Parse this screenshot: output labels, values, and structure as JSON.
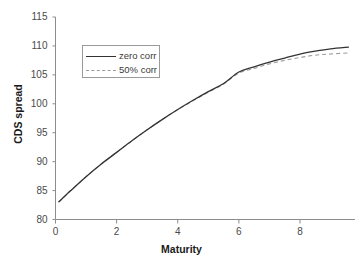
{
  "chart_data": {
    "type": "line",
    "title": "",
    "xlabel": "Maturity",
    "ylabel": "CDS spread",
    "xlim": [
      0,
      9.8
    ],
    "ylim": [
      80,
      115
    ],
    "xticks": [
      "0",
      "2",
      "4",
      "6",
      "8"
    ],
    "xtick_values": [
      0,
      2,
      4,
      6,
      8
    ],
    "yticks": [
      "80",
      "85",
      "90",
      "95",
      "100",
      "105",
      "110",
      "115"
    ],
    "ytick_values": [
      80,
      85,
      90,
      95,
      100,
      105,
      110,
      115
    ],
    "grid": false,
    "legend_position": "upper left",
    "series": [
      {
        "name": "zero corr",
        "style": "solid",
        "color": "#333333",
        "x": [
          0.1,
          0.5,
          1.0,
          1.5,
          2.0,
          2.5,
          3.0,
          3.5,
          4.0,
          4.5,
          5.0,
          5.5,
          6.0,
          6.5,
          7.0,
          7.5,
          8.0,
          8.5,
          9.0,
          9.6
        ],
        "y": [
          83.0,
          85.0,
          87.4,
          89.6,
          91.6,
          93.6,
          95.5,
          97.3,
          99.0,
          100.6,
          102.1,
          103.5,
          105.5,
          106.4,
          107.2,
          107.9,
          108.6,
          109.1,
          109.5,
          109.8
        ]
      },
      {
        "name": "50% corr",
        "style": "dashed",
        "color": "#9b9b9b",
        "x": [
          0.1,
          0.5,
          1.0,
          1.5,
          2.0,
          2.5,
          3.0,
          3.5,
          4.0,
          4.5,
          5.0,
          5.5,
          6.0,
          6.5,
          7.0,
          7.5,
          8.0,
          8.5,
          9.0,
          9.6
        ],
        "y": [
          83.0,
          85.0,
          87.4,
          89.6,
          91.6,
          93.6,
          95.5,
          97.3,
          99.0,
          100.5,
          102.0,
          103.4,
          105.3,
          106.1,
          106.9,
          107.5,
          108.0,
          108.4,
          108.6,
          108.8
        ]
      }
    ]
  },
  "axes": {
    "x_title": "Maturity",
    "y_title": "CDS spread"
  },
  "legend": {
    "entries": [
      {
        "label": "zero corr"
      },
      {
        "label": "50% corr"
      }
    ]
  },
  "colors": {
    "series_solid": "#333333",
    "series_dashed": "#9b9b9b",
    "axis": "#8c8c8c",
    "tick_text": "#4a4a4a",
    "title_text": "#1a1a1a",
    "background": "#ffffff"
  }
}
